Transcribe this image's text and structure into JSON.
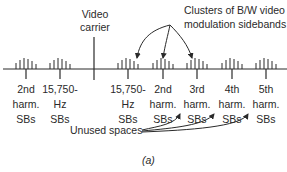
{
  "diagram": {
    "carrier_label": [
      "Video",
      "carrier"
    ],
    "clusters_note": [
      "Clusters of B/W video",
      "modulation sidebands"
    ],
    "unused_note": "Unused spaces",
    "caption": "(a)",
    "markers": [
      {
        "x": 26,
        "lines": [
          "2nd",
          "harm.",
          "SBs"
        ]
      },
      {
        "x": 60,
        "lines": [
          "15,750-",
          "Hz",
          "SBs"
        ]
      },
      {
        "x": 94,
        "lines": []
      },
      {
        "x": 128,
        "lines": [
          "15,750-",
          "Hz",
          "SBs"
        ]
      },
      {
        "x": 163,
        "lines": [
          "2nd",
          "harm.",
          "SBs"
        ]
      },
      {
        "x": 197,
        "lines": [
          "3rd",
          "harm.",
          "SBs"
        ]
      },
      {
        "x": 232,
        "lines": [
          "4th",
          "harm.",
          "SBs"
        ]
      },
      {
        "x": 266,
        "lines": [
          "5th",
          "harm.",
          "SBs"
        ]
      }
    ]
  }
}
